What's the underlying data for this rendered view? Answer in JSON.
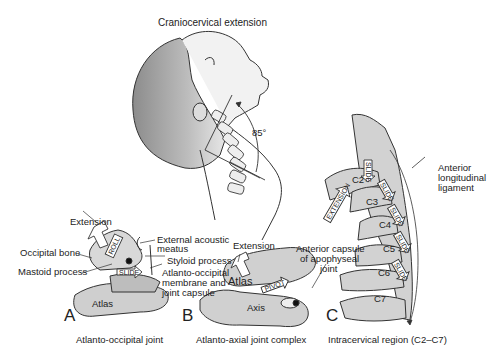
{
  "title": "Craniocervical extension",
  "angle_label": "85°",
  "panels": {
    "A": {
      "letter": "A",
      "caption": "Atlanto-occipital joint",
      "labels": {
        "extension": "Extension",
        "occipital_bone": "Occipital bone",
        "mastoid_process": "Mastoid process",
        "external_acoustic_1": "External acoustic",
        "external_acoustic_2": "meatus",
        "styloid_process": "Styloid process",
        "aom_1": "Atlanto-occipital",
        "aom_2": "membrane and",
        "aom_3": "joint capsule",
        "atlas": "Atlas"
      },
      "arrows": {
        "roll": "ROLL",
        "slide": "SLIDE"
      }
    },
    "B": {
      "letter": "B",
      "caption": "Atlanto-axial joint complex",
      "labels": {
        "extension": "Extension",
        "atlas": "Atlas",
        "axis": "Axis",
        "anterior_capsule_1": "Anterior capsule",
        "anterior_capsule_2": "of apophyseal",
        "anterior_capsule_3": "joint"
      },
      "arrows": {
        "pivot": "PIVOT"
      }
    },
    "C": {
      "letter": "C",
      "caption": "Intracervical region (C2–C7)",
      "labels": {
        "all_1": "Anterior",
        "all_2": "longitudinal",
        "all_3": "ligament"
      },
      "vertebrae": [
        "C2",
        "C3",
        "C4",
        "C5",
        "C6",
        "C7"
      ],
      "arrows": {
        "extension": "EXTENSION",
        "slide": "SLIDE"
      }
    }
  }
}
